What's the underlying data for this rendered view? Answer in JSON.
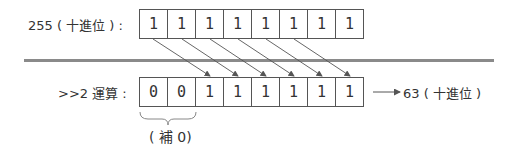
{
  "top_row": {
    "label": "255 ( 十進位 ) :",
    "bits": [
      "1",
      "1",
      "1",
      "1",
      "1",
      "1",
      "1",
      "1"
    ]
  },
  "bottom_row": {
    "label": ">>2 運算 :",
    "bits": [
      "0",
      "0",
      "1",
      "1",
      "1",
      "1",
      "1",
      "1"
    ],
    "result_label": "63 ( 十進位 )",
    "padding_note": "( 補 0)"
  },
  "colors": {
    "divider": "#8a8a8a",
    "border": "#555555",
    "arrow": "#555555"
  }
}
